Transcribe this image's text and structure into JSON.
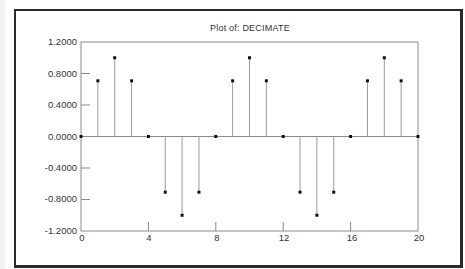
{
  "chart_data": {
    "type": "stem",
    "title": "Plot of: DECIMATE",
    "xlabel": "",
    "ylabel": "",
    "xlim": [
      0,
      20
    ],
    "ylim": [
      -1.2,
      1.2
    ],
    "grid": false,
    "legend": null,
    "x_ticks": [
      0,
      4,
      8,
      12,
      16,
      20
    ],
    "x_tick_labels": [
      "0",
      "4",
      "8",
      "12",
      "16",
      "20"
    ],
    "y_ticks": [
      1.2,
      0.8,
      0.4,
      0.0,
      -0.4,
      -0.8,
      -1.2
    ],
    "y_tick_labels": [
      "1.2000",
      "0.8000",
      "0.4000",
      "0.0000",
      "-0.4000",
      "-0.8000",
      "-1.2000"
    ],
    "x": [
      0,
      1,
      2,
      3,
      4,
      5,
      6,
      7,
      8,
      9,
      10,
      11,
      12,
      13,
      14,
      15,
      16,
      17,
      18,
      19,
      20
    ],
    "values": [
      0.0,
      0.7071,
      1.0,
      0.7071,
      0.0,
      -0.7071,
      -1.0,
      -0.7071,
      0.0,
      0.7071,
      1.0,
      0.7071,
      0.0,
      -0.7071,
      -1.0,
      -0.7071,
      0.0,
      0.7071,
      1.0,
      0.7071,
      0.0
    ]
  },
  "labels": {
    "title": "Plot of: DECIMATE",
    "y": [
      "1.2000",
      "0.8000",
      "0.4000",
      "0.0000",
      "-0.4000",
      "-0.8000",
      "-1.2000"
    ],
    "x": [
      "0",
      "4",
      "8",
      "12",
      "16",
      "20"
    ]
  },
  "colors": {
    "frame": "#2a2a2a",
    "axes": "#8a8a8a",
    "stem": "#9a9a9a",
    "marker": "#111111",
    "text": "#333333"
  }
}
